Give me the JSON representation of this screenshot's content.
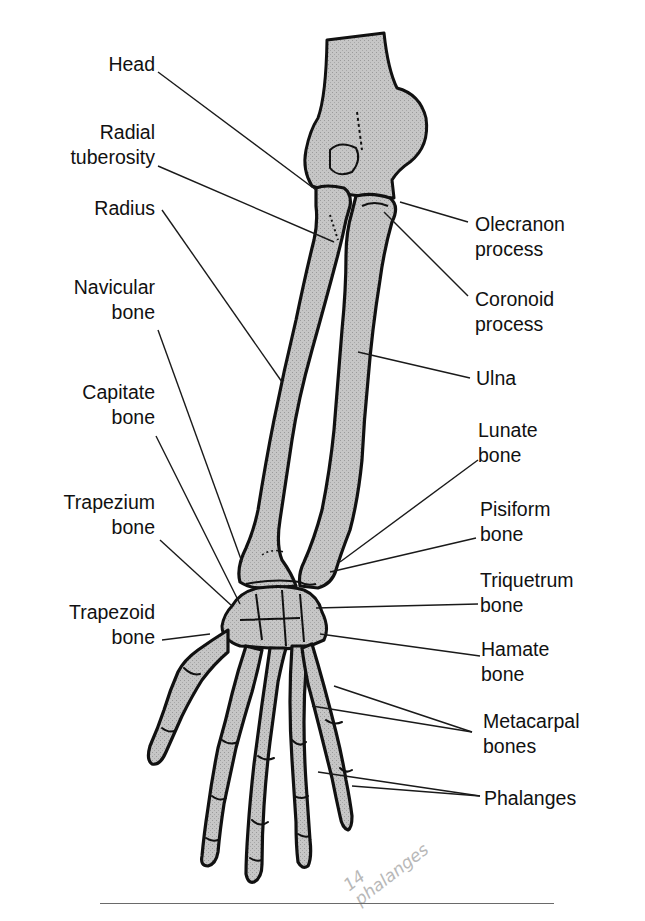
{
  "figure": {
    "colors": {
      "bone_fill": "#c4c4c4",
      "outline": "#111111",
      "leader": "#1a1a1a",
      "handwriting": "#b8b8b8"
    },
    "labels_left": [
      {
        "id": "head",
        "text": "Head"
      },
      {
        "id": "radial-tuberosity",
        "text": "Radial\ntuberosity"
      },
      {
        "id": "radius",
        "text": "Radius"
      },
      {
        "id": "navicular-bone",
        "text": "Navicular\nbone"
      },
      {
        "id": "capitate-bone",
        "text": "Capitate\nbone"
      },
      {
        "id": "trapezium-bone",
        "text": "Trapezium\nbone"
      },
      {
        "id": "trapezoid-bone",
        "text": "Trapezoid\nbone"
      }
    ],
    "labels_right": [
      {
        "id": "olecranon-process",
        "text": "Olecranon\nprocess"
      },
      {
        "id": "coronoid-process",
        "text": "Coronoid\nprocess"
      },
      {
        "id": "ulna",
        "text": "Ulna"
      },
      {
        "id": "lunate-bone",
        "text": "Lunate\nbone"
      },
      {
        "id": "pisiform-bone",
        "text": "Pisiform\nbone"
      },
      {
        "id": "triquetrum-bone",
        "text": "Triquetrum\nbone"
      },
      {
        "id": "hamate-bone",
        "text": "Hamate\nbone"
      },
      {
        "id": "metacarpal-bones",
        "text": "Metacarpal\nbones"
      },
      {
        "id": "phalanges",
        "text": "Phalanges"
      }
    ],
    "handwritten_note": "14\nphalanges"
  }
}
